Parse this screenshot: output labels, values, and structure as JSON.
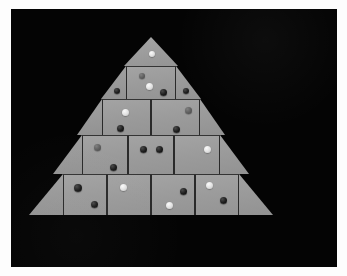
{
  "scene": {
    "title": "Gray triangular tile assembly on black background",
    "background_color": "#040404",
    "frame_color": "#fdfdfd",
    "tile_color": "#9b9b9b",
    "seam_color": "#2a2a2a",
    "dot_colors": {
      "dark": "#141414",
      "light": "#ededed",
      "mid": "#5d5d5d"
    }
  },
  "figure": {
    "shape": "stepped-triangle",
    "row_count": 5,
    "rows": [
      {
        "index": 1,
        "label": "apex-row",
        "x": 113,
        "y": 28,
        "width": 54,
        "height": 29,
        "pieces": [
          {
            "kind": "triangle-up",
            "name": "apex-triangle",
            "x": 0,
            "y": 0,
            "width": 54,
            "height": 29,
            "dots": [
              {
                "tone": "light",
                "x": 25,
                "y": 14,
                "size": 6
              }
            ]
          }
        ]
      },
      {
        "index": 2,
        "label": "second-row",
        "x": 90,
        "y": 57,
        "width": 100,
        "height": 33,
        "pieces": [
          {
            "kind": "triangle-left",
            "name": "row2-left-triangle",
            "x": 0,
            "y": 0,
            "width": 25,
            "height": 33,
            "dots": [
              {
                "tone": "dark",
                "x": 13,
                "y": 22,
                "size": 6
              }
            ]
          },
          {
            "kind": "square",
            "name": "row2-square-1",
            "x": 25,
            "y": 0,
            "width": 50,
            "height": 33,
            "dots": [
              {
                "tone": "mid",
                "x": 12,
                "y": 6,
                "size": 6
              },
              {
                "tone": "light",
                "x": 19,
                "y": 16,
                "size": 7
              },
              {
                "tone": "dark",
                "x": 33,
                "y": 22,
                "size": 7
              }
            ]
          },
          {
            "kind": "triangle-right",
            "name": "row2-right-triangle",
            "x": 75,
            "y": 0,
            "width": 25,
            "height": 33,
            "dots": [
              {
                "tone": "dark",
                "x": 7,
                "y": 22,
                "size": 6
              }
            ]
          }
        ]
      },
      {
        "index": 3,
        "label": "third-row",
        "x": 66,
        "y": 90,
        "width": 148,
        "height": 36,
        "pieces": [
          {
            "kind": "triangle-left",
            "name": "row3-left-triangle",
            "x": 0,
            "y": 0,
            "width": 25,
            "height": 36,
            "dots": []
          },
          {
            "kind": "square",
            "name": "row3-square-1",
            "x": 25,
            "y": 0,
            "width": 49,
            "height": 36,
            "dots": [
              {
                "tone": "light",
                "x": 19,
                "y": 9,
                "size": 7
              },
              {
                "tone": "dark",
                "x": 14,
                "y": 25,
                "size": 7
              }
            ]
          },
          {
            "kind": "square",
            "name": "row3-square-2",
            "x": 74,
            "y": 0,
            "width": 49,
            "height": 36,
            "dots": [
              {
                "tone": "mid",
                "x": 33,
                "y": 7,
                "size": 7
              },
              {
                "tone": "dark",
                "x": 21,
                "y": 26,
                "size": 7
              }
            ]
          },
          {
            "kind": "triangle-right",
            "name": "row3-right-triangle",
            "x": 123,
            "y": 0,
            "width": 25,
            "height": 36,
            "dots": []
          }
        ]
      },
      {
        "index": 4,
        "label": "fourth-row",
        "x": 42,
        "y": 126,
        "width": 196,
        "height": 39,
        "pieces": [
          {
            "kind": "triangle-left",
            "name": "row4-left-triangle",
            "x": 0,
            "y": 0,
            "width": 29,
            "height": 39,
            "dots": []
          },
          {
            "kind": "square",
            "name": "row4-square-1",
            "x": 29,
            "y": 0,
            "width": 46,
            "height": 39,
            "dots": [
              {
                "tone": "mid",
                "x": 11,
                "y": 8,
                "size": 7
              },
              {
                "tone": "dark",
                "x": 27,
                "y": 28,
                "size": 7
              }
            ]
          },
          {
            "kind": "square",
            "name": "row4-square-2",
            "x": 75,
            "y": 0,
            "width": 46,
            "height": 39,
            "dots": [
              {
                "tone": "dark",
                "x": 11,
                "y": 10,
                "size": 7
              },
              {
                "tone": "dark",
                "x": 27,
                "y": 10,
                "size": 7
              }
            ]
          },
          {
            "kind": "square",
            "name": "row4-square-3",
            "x": 121,
            "y": 0,
            "width": 46,
            "height": 39,
            "dots": [
              {
                "tone": "light",
                "x": 29,
                "y": 10,
                "size": 7
              }
            ]
          },
          {
            "kind": "triangle-right",
            "name": "row4-right-triangle",
            "x": 167,
            "y": 0,
            "width": 29,
            "height": 39,
            "dots": []
          }
        ]
      },
      {
        "index": 5,
        "label": "bottom-row",
        "x": 18,
        "y": 165,
        "width": 244,
        "height": 41,
        "pieces": [
          {
            "kind": "triangle-left",
            "name": "row5-left-triangle",
            "x": 0,
            "y": 0,
            "width": 34,
            "height": 41,
            "dots": []
          },
          {
            "kind": "square",
            "name": "row5-square-1",
            "x": 34,
            "y": 0,
            "width": 44,
            "height": 41,
            "dots": [
              {
                "tone": "dark",
                "x": 10,
                "y": 9,
                "size": 8
              },
              {
                "tone": "dark",
                "x": 27,
                "y": 26,
                "size": 7
              }
            ]
          },
          {
            "kind": "square",
            "name": "row5-square-2",
            "x": 78,
            "y": 0,
            "width": 44,
            "height": 41,
            "dots": [
              {
                "tone": "light",
                "x": 12,
                "y": 9,
                "size": 7
              }
            ]
          },
          {
            "kind": "square",
            "name": "row5-square-3",
            "x": 122,
            "y": 0,
            "width": 44,
            "height": 41,
            "dots": [
              {
                "tone": "dark",
                "x": 28,
                "y": 13,
                "size": 7
              },
              {
                "tone": "light",
                "x": 14,
                "y": 27,
                "size": 7
              }
            ]
          },
          {
            "kind": "square",
            "name": "row5-square-4",
            "x": 166,
            "y": 0,
            "width": 44,
            "height": 41,
            "dots": [
              {
                "tone": "light",
                "x": 10,
                "y": 7,
                "size": 7
              },
              {
                "tone": "dark",
                "x": 24,
                "y": 22,
                "size": 7
              }
            ]
          },
          {
            "kind": "triangle-right",
            "name": "row5-right-triangle",
            "x": 210,
            "y": 0,
            "width": 34,
            "height": 41,
            "dots": []
          }
        ]
      }
    ]
  }
}
